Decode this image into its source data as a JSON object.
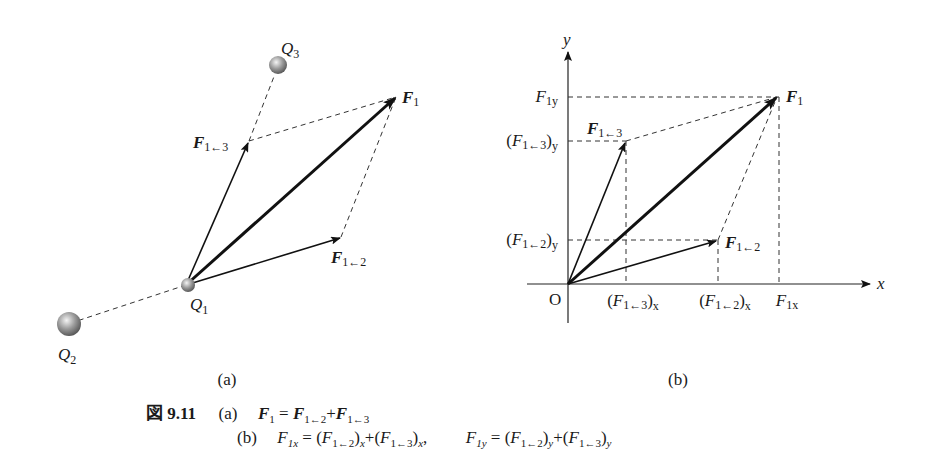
{
  "figure": {
    "number_label": "図 9.11",
    "panel_a_label": "(a)",
    "panel_b_label": "(b)"
  },
  "panel_a": {
    "charges": [
      {
        "name": "Q",
        "sub": "1"
      },
      {
        "name": "Q",
        "sub": "2"
      },
      {
        "name": "Q",
        "sub": "3"
      }
    ],
    "vectors": [
      {
        "name": "F",
        "sub": "1"
      },
      {
        "name": "F",
        "sub": "1←3"
      },
      {
        "name": "F",
        "sub": "1←2"
      }
    ]
  },
  "panel_b": {
    "axes": {
      "x": "x",
      "y": "y",
      "origin": "O"
    },
    "vectors": [
      {
        "name": "F",
        "sub": "1"
      },
      {
        "name": "F",
        "sub": "1←3"
      },
      {
        "name": "F",
        "sub": "1←2"
      }
    ],
    "y_ticks": [
      {
        "name": "F",
        "sub": "1y"
      },
      {
        "open": "(",
        "name": "F",
        "sub": "1←3",
        "close": ")",
        "comp": "y"
      },
      {
        "open": "(",
        "name": "F",
        "sub": "1←2",
        "close": ")",
        "comp": "y"
      }
    ],
    "x_ticks": [
      {
        "open": "(",
        "name": "F",
        "sub": "1←3",
        "close": ")",
        "comp": "x"
      },
      {
        "open": "(",
        "name": "F",
        "sub": "1←2",
        "close": ")",
        "comp": "x"
      },
      {
        "name": "F",
        "sub": "1x"
      }
    ]
  },
  "caption": {
    "line_a_tag": "(a)",
    "line_a": {
      "lhs": "F",
      "lhs_sub": "1",
      "eq": " = ",
      "t1": "F",
      "t1_sub": "1←2",
      "plus": "+",
      "t2": "F",
      "t2_sub": "1←3"
    },
    "line_b_tag": "(b)",
    "line_b1": {
      "lhs": "F",
      "lhs_sub": "1x",
      "eq": " = (",
      "t1": "F",
      "t1_sub": "1←2",
      "mid": ")",
      "c1": "x",
      "plus": "+(",
      "t2": "F",
      "t2_sub": "1←3",
      "end": ")",
      "c2": "x",
      "comma": ","
    },
    "line_b2": {
      "lhs": "F",
      "lhs_sub": "1y",
      "eq": " = (",
      "t1": "F",
      "t1_sub": "1←2",
      "mid": ")",
      "c1": "y",
      "plus": "+(",
      "t2": "F",
      "t2_sub": "1←3",
      "end": ")",
      "c2": "y"
    }
  }
}
